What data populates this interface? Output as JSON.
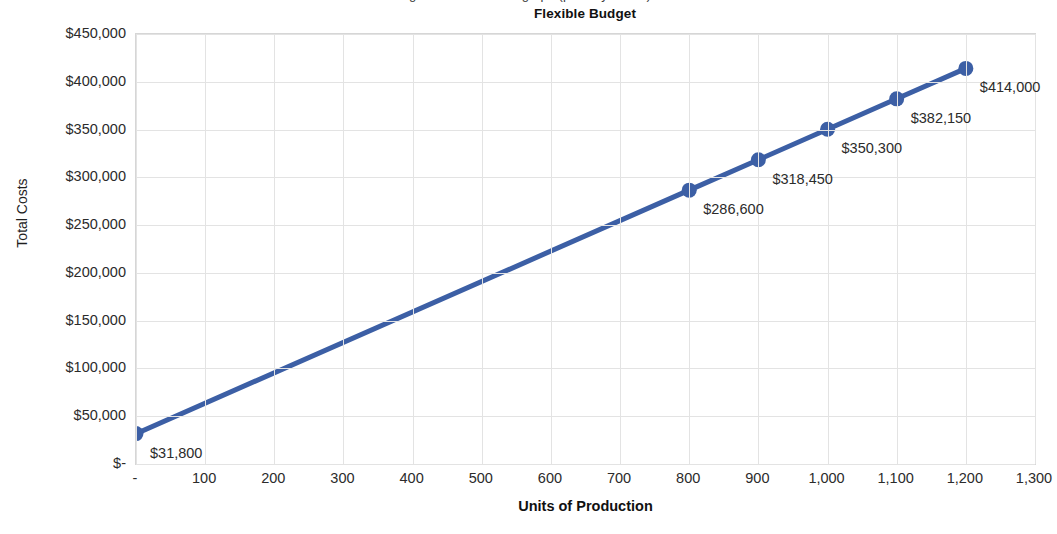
{
  "caption": {
    "clipped_top_text": "Figure: total cost line graph (partially cut off)"
  },
  "chart_data": {
    "type": "line",
    "title": "Flexible Budget",
    "xlabel": "Units of Production",
    "ylabel": "Total Costs",
    "grid": true,
    "legend": false,
    "xlim": [
      0,
      1300
    ],
    "ylim": [
      0,
      450000
    ],
    "x_tick_labels": [
      "-",
      "100",
      "200",
      "300",
      "400",
      "500",
      "600",
      "700",
      "800",
      "900",
      "1,000",
      "1,100",
      "1,200",
      "1,300"
    ],
    "x_tick_values": [
      0,
      100,
      200,
      300,
      400,
      500,
      600,
      700,
      800,
      900,
      1000,
      1100,
      1200,
      1300
    ],
    "y_tick_labels": [
      "$450,000",
      "$400,000",
      "$350,000",
      "$300,000",
      "$250,000",
      "$200,000",
      "$150,000",
      "$100,000",
      "$50,000",
      "$-"
    ],
    "y_tick_values": [
      450000,
      400000,
      350000,
      300000,
      250000,
      200000,
      150000,
      100000,
      50000,
      0
    ],
    "series": [
      {
        "name": "Total Costs",
        "color": "#3C5FA5",
        "marker": "circle",
        "x": [
          0,
          800,
          900,
          1000,
          1100,
          1200
        ],
        "values": [
          31800,
          286600,
          318450,
          350300,
          382150,
          414000
        ],
        "point_labels": [
          "$31,800",
          "$286,600",
          "$318,450",
          "$350,300",
          "$382,150",
          "$414,000"
        ]
      }
    ]
  },
  "style": {
    "line_color": "#3C5FA5",
    "marker_color": "#3C5FA5",
    "grid_color": "#e3e3e3",
    "plot_border_color": "#d6d6d6",
    "text_color": "#2b2b2b",
    "background": "#ffffff"
  }
}
